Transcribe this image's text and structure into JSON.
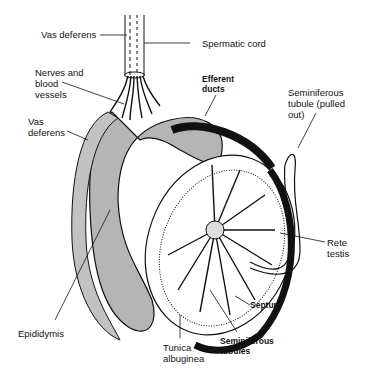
{
  "diagram": {
    "labels": {
      "vas_deferens_top": "Vas deferens",
      "spermatic_cord": "Spermatic cord",
      "nerves_blood_vessels": "Nerves and\nblood\nvessels",
      "vas_deferens_left": "Vas\ndeferens",
      "efferent_ducts": "Efferent\nducts",
      "seminiferous_tubule_pulled": "Seminiferous\ntubule (pulled\nout)",
      "rete_testis": "Rete\ntestis",
      "septum": "Septum",
      "seminiferous_tubules": "Seminiferous\ntubules",
      "tunica_albuginea": "Tunica\nalbuginea",
      "epididymis": "Epididymis"
    },
    "colors": {
      "ink": "#111111",
      "epididymis_fill": "#b5b5b5",
      "background": "#ffffff"
    }
  }
}
